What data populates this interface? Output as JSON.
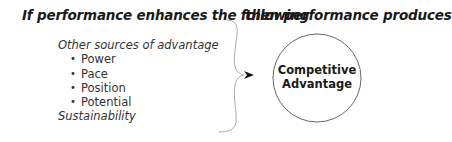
{
  "headings": {
    "left": "If performance enhances the following",
    "right": "then performance produces"
  },
  "inputs": {
    "group_label": "Other sources of advantage",
    "items": [
      "Power",
      "Pace",
      "Position",
      "Potential"
    ],
    "footer_label": "Sustainability"
  },
  "outcome": {
    "line1": "Competitive",
    "line2": "Advantage"
  },
  "colors": {
    "text": "#1a1a1a",
    "brace": "#aaaaaa",
    "circle": "#555555",
    "arrow": "#111111"
  }
}
